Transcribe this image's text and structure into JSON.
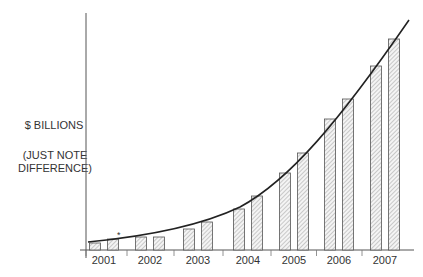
{
  "chart_data": {
    "type": "bar",
    "title": "",
    "xlabel": "",
    "ylabel": "$ BILLIONS",
    "ylabel_note": "(JUST NOTE DIFFERENCE)",
    "categories": [
      "2001",
      "2002",
      "2003",
      "2004",
      "2005",
      "2006",
      "2007"
    ],
    "series": [
      {
        "name": "bar A",
        "values": [
          7,
          13,
          21,
          41,
          77,
          131,
          184
        ]
      },
      {
        "name": "bar B",
        "values": [
          11,
          13,
          28,
          54,
          97,
          151,
          211
        ]
      }
    ],
    "trend_line": {
      "type": "curve",
      "shape": "exponential growth",
      "description": "smooth curve passing over bar tops"
    },
    "value_units": "relative (no numeric y-axis ticks shown)",
    "grid": false,
    "legend": "none",
    "annotations": [
      "*"
    ],
    "bar_fill": "diagonal hatch"
  },
  "labels": {
    "ylabel_line1": "$ BILLIONS",
    "ylabel_line2": "(JUST NOTE",
    "ylabel_line3": "DIFFERENCE)",
    "asterisk": "*"
  }
}
